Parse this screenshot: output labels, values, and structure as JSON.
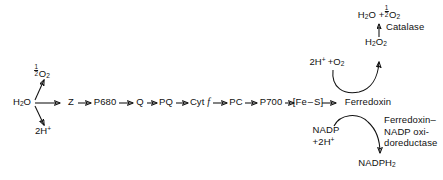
{
  "diagram": {
    "type": "flow-diagram",
    "stroke_color": "#111111",
    "background_color": "#ffffff",
    "main_chain": {
      "nodes": [
        {
          "id": "h2o",
          "label_html": "H<sub>2</sub>O",
          "label_text": "H2O",
          "x": 22,
          "y": 103
        },
        {
          "id": "z",
          "label_html": "Z",
          "label_text": "Z",
          "x": 71,
          "y": 103
        },
        {
          "id": "p680",
          "label_html": "P680",
          "label_text": "P680",
          "x": 104,
          "y": 103
        },
        {
          "id": "q",
          "label_html": "Q",
          "label_text": "Q",
          "x": 140,
          "y": 103
        },
        {
          "id": "pq",
          "label_html": "PQ",
          "label_text": "PQ",
          "x": 166,
          "y": 103
        },
        {
          "id": "cytf",
          "label_html": "Cyt <span class=\"it\">f</span>",
          "label_text": "Cyt f",
          "x": 199,
          "y": 103
        },
        {
          "id": "pc",
          "label_html": "PC",
          "label_text": "PC",
          "x": 236,
          "y": 103
        },
        {
          "id": "p700",
          "label_html": "P700",
          "label_text": "P700",
          "x": 270,
          "y": 103
        },
        {
          "id": "fes",
          "label_html": "[Fe &#8211; S]",
          "label_text": "[Fe - S]",
          "x": 307,
          "y": 103
        },
        {
          "id": "ferredoxin",
          "label_html": "Ferredoxin",
          "label_text": "Ferredoxin",
          "x": 367,
          "y": 103
        }
      ]
    },
    "water_split": {
      "oxygen": {
        "label_text": "1/2 O2",
        "numerator": "1",
        "denominator": "2",
        "species_html": "O<sub>2</sub>",
        "x": 41,
        "y": 70
      },
      "protons": {
        "label_html": "2H<sup>+</sup>",
        "label_text": "2H+",
        "x": 42,
        "y": 131
      }
    },
    "catalase_branch": {
      "product": {
        "label_text": "H2O + 1/2 O2",
        "prefix_html": "H<sub>2</sub>O +",
        "numerator": "1",
        "denominator": "2",
        "species_html": "O<sub>2</sub>",
        "x": 378,
        "y": 10
      },
      "enzyme": {
        "label_text": "Catalase",
        "x": 386,
        "y": 28
      },
      "substrate": {
        "label_html": "H<sub>2</sub>O<sub>2</sub>",
        "label_text": "H2O2",
        "x": 375,
        "y": 42
      },
      "reactant": {
        "label_html": "2H<sup>+</sup> &#8202;+O<sub>2</sub>",
        "label_text": "2H+ +O2",
        "x": 320,
        "y": 60
      }
    },
    "nadp_branch": {
      "reactant": {
        "line1_html": "NADP",
        "line2_html": "+2H<sup>+</sup>",
        "label_text": "NADP +2H+",
        "x": 322,
        "y": 130
      },
      "enzyme": {
        "label_text": "Ferredoxin-\nNADP oxi-\ndoreductase",
        "x": 384,
        "y": 120
      },
      "product": {
        "label_html": "NADPH<sub>2</sub>",
        "label_text": "NADPH2",
        "x": 374,
        "y": 162
      }
    }
  }
}
